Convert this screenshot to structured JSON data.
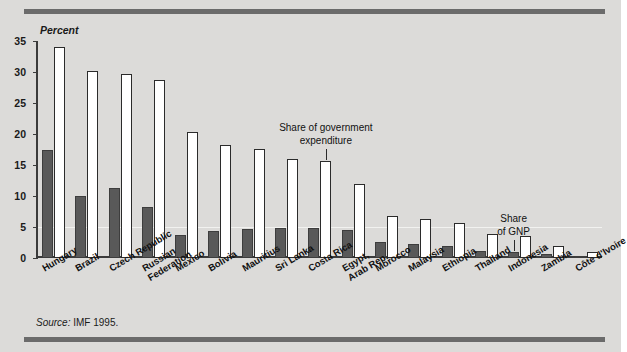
{
  "figure": {
    "axis_title": "Percent",
    "source_prefix": "Source:",
    "source_text": "IMF 1995."
  },
  "annotations": {
    "gov": {
      "line1": "Share of government",
      "line2": "expenditure",
      "target": "Costa Rica"
    },
    "gnp": {
      "line1": "Share",
      "line2": "of GNP",
      "target": "Indonesia"
    }
  },
  "colors": {
    "background": "#dcdbd9",
    "gnp_bar": "#595959",
    "gov_bar": "#ffffff",
    "axis": "#3b3b3b",
    "rule": "#6b6b6b"
  },
  "chart_data": {
    "type": "bar",
    "title": "",
    "subtitle": "",
    "xlabel": "",
    "ylabel": "Percent",
    "ylim": [
      0,
      35
    ],
    "yticks": [
      0,
      5,
      10,
      15,
      20,
      25,
      30,
      35
    ],
    "grid": false,
    "legend_position": "annotation-callouts",
    "categories": [
      "Hungary",
      "Brazil",
      "Czech Republic",
      "Russian Federation",
      "Mexico",
      "Bolivia",
      "Mauritius",
      "Sri Lanka",
      "Costa Rica",
      "Egypt, Arab Rep.",
      "Morocco",
      "Malaysia",
      "Ethiopia",
      "Thailand",
      "Indonesia",
      "Zambia",
      "Côte d'Ivoire"
    ],
    "category_lines": [
      [
        "Hungary"
      ],
      [
        "Brazil"
      ],
      [
        "Czech Republic"
      ],
      [
        "Russian",
        "Federation"
      ],
      [
        "Mexico"
      ],
      [
        "Bolivia"
      ],
      [
        "Mauritius"
      ],
      [
        "Sri Lanka"
      ],
      [
        "Costa Rica"
      ],
      [
        "Egypt,",
        "Arab Rep."
      ],
      [
        "Morocco"
      ],
      [
        "Malaysia"
      ],
      [
        "Ethiopia"
      ],
      [
        "Thailand"
      ],
      [
        "Indonesia"
      ],
      [
        "Zambia"
      ],
      [
        "Côte d'Ivoire"
      ]
    ],
    "series": [
      {
        "name": "Share of GNP",
        "color": "#595959",
        "values": [
          17.5,
          10.0,
          11.3,
          8.2,
          3.7,
          4.4,
          4.6,
          4.9,
          4.8,
          4.5,
          2.6,
          2.2,
          1.9,
          1.1,
          1.0,
          0.7,
          0.3
        ]
      },
      {
        "name": "Share of government expenditure",
        "color": "#ffffff",
        "values": [
          34.0,
          30.2,
          29.6,
          28.7,
          20.3,
          18.3,
          17.6,
          16.0,
          15.6,
          11.9,
          6.7,
          6.3,
          5.7,
          3.9,
          3.5,
          1.9,
          0.9
        ]
      }
    ]
  }
}
